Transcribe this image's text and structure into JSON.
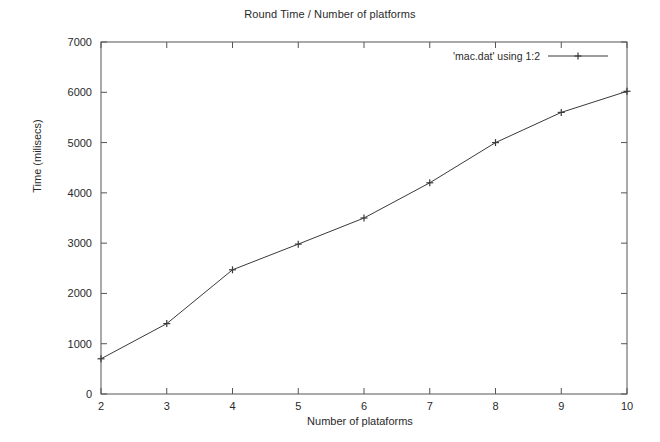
{
  "chart_data": {
    "type": "line",
    "title": "Round Time / Number of platforms",
    "xlabel": "Number of plataforms",
    "ylabel": "Time (milisecs)",
    "x": [
      2,
      3,
      4,
      5,
      6,
      7,
      8,
      9,
      10
    ],
    "values": [
      700,
      1400,
      2470,
      2980,
      3500,
      4200,
      5000,
      5600,
      6020
    ],
    "series": [
      {
        "name": "'mac.dat' using 1:2",
        "values": [
          700,
          1400,
          2470,
          2980,
          3500,
          4200,
          5000,
          5600,
          6020
        ]
      }
    ],
    "xlim": [
      2,
      10
    ],
    "ylim": [
      0,
      7000
    ],
    "xticks": [
      "2",
      "3",
      "4",
      "5",
      "6",
      "7",
      "8",
      "9",
      "10"
    ],
    "yticks": [
      "0",
      "1000",
      "2000",
      "3000",
      "4000",
      "5000",
      "6000",
      "7000"
    ],
    "ytick_values": [
      0,
      1000,
      2000,
      3000,
      4000,
      5000,
      6000,
      7000
    ],
    "grid": false,
    "legend_position": "top-right",
    "marker": "plus",
    "line_color": "#3a3a3a",
    "axis_color": "#555555"
  },
  "legend": {
    "entry_label": "'mac.dat' using 1:2"
  }
}
